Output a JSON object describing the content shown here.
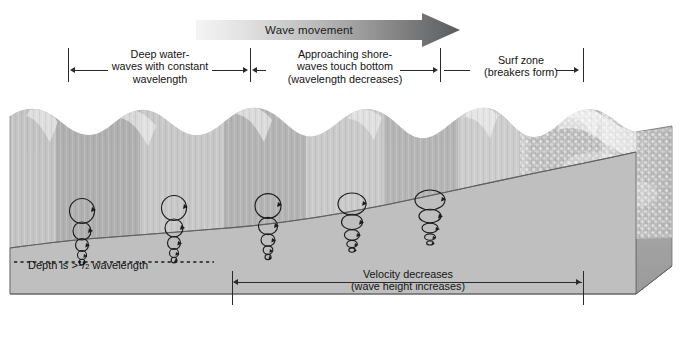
{
  "figure": {
    "wave_movement_label": "Wave movement",
    "arrow_gradient_from": "#f2f2f2",
    "arrow_gradient_to": "#58595b"
  },
  "zones": [
    {
      "id": "deep-water",
      "lines": [
        "Deep water-",
        "waves with constant",
        "wavelength"
      ],
      "left": 68,
      "right": 250
    },
    {
      "id": "approaching-shore",
      "lines": [
        "Approaching shore-",
        "waves touch bottom",
        "(wavelength decreases)"
      ],
      "left": 250,
      "right": 440
    },
    {
      "id": "surf-zone",
      "lines": [
        "Surf zone",
        "(breakers form)"
      ],
      "left": 440,
      "right": 583
    }
  ],
  "annotations": {
    "depth": {
      "prefix": "Depth is ",
      "gt": ">",
      "numerator": "1",
      "slash": "/",
      "denominator": "2",
      "suffix": " wavelength"
    },
    "velocity": {
      "lines": [
        "Velocity decreases",
        "(wave height increases)"
      ],
      "left": 232,
      "right": 584
    }
  },
  "colors": {
    "water_light": "#d9d9d9",
    "water_mid": "#b9b9b9",
    "water_dark": "#8e8e8e",
    "seafloor": "#bdbdbd",
    "block_side": "#a6a6a6",
    "foam": "#ffffff",
    "ink": "#2a2a2a"
  },
  "orbitals": {
    "description": "water-particle orbital motion columns",
    "columns": [
      {
        "x": 82,
        "circles": 5,
        "top_r": 12.5,
        "flattening": 1.0
      },
      {
        "x": 174,
        "circles": 5,
        "top_r": 12.5,
        "flattening": 1.0
      },
      {
        "x": 268,
        "circles": 5,
        "top_r": 13.0,
        "flattening": 1.05
      },
      {
        "x": 352,
        "circles": 5,
        "top_r": 13.5,
        "flattening": 1.25
      },
      {
        "x": 430,
        "circles": 5,
        "top_r": 14.0,
        "flattening": 1.45
      }
    ]
  }
}
